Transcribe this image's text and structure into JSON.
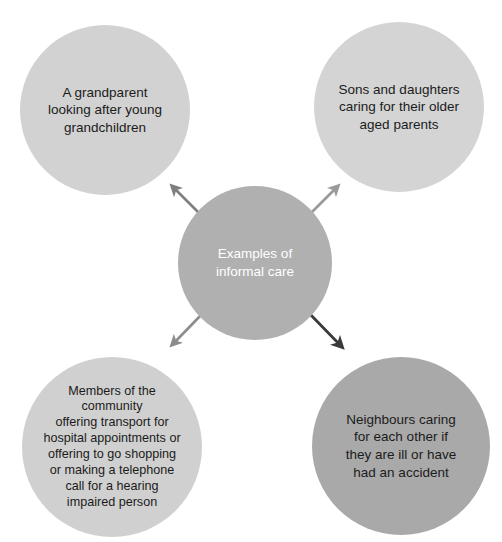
{
  "diagram": {
    "title": "Examples of informal care",
    "type": "hub-and-spoke",
    "background_color": "#ffffff",
    "center": {
      "name": "center-hub",
      "label": "Examples of\ninformal care",
      "fill_color": "#b0b0b0",
      "text_color": "#ffffff"
    },
    "nodes": [
      {
        "name": "grandparent",
        "label": "A grandparent\nlooking after young\ngrandchildren",
        "position": "top-left",
        "fill_color": "#d2d2d2",
        "text_color": "#1b1b1b"
      },
      {
        "name": "sons-daughters",
        "label": "Sons and daughters\ncaring for their older\naged parents",
        "position": "top-right",
        "fill_color": "#d4d4d4",
        "text_color": "#1b1b1b"
      },
      {
        "name": "community",
        "label": "Members of the\ncommunity\noffering transport for\nhospital appointments or\noffering to go shopping\nor making a telephone\ncall for a hearing\nimpaired person",
        "position": "bottom-left",
        "fill_color": "#d0d0d0",
        "text_color": "#1b1b1b"
      },
      {
        "name": "neighbours",
        "label": "Neighbours caring\nfor each other if\nthey are ill or have\nhad an accident",
        "position": "bottom-right",
        "fill_color": "#a9a9a9",
        "text_color": "#1b1b1b"
      }
    ],
    "arrows": [
      {
        "name": "arrow-to-grandparent",
        "from": "center-hub",
        "to": "grandparent",
        "direction": "up-left",
        "color": "#7f7f7f"
      },
      {
        "name": "arrow-to-sons-daughters",
        "from": "center-hub",
        "to": "sons-daughters",
        "direction": "up-right",
        "color": "#9a9a9a"
      },
      {
        "name": "arrow-to-community",
        "from": "center-hub",
        "to": "community",
        "direction": "down-left",
        "color": "#8c8c8c"
      },
      {
        "name": "arrow-to-neighbours",
        "from": "center-hub",
        "to": "neighbours",
        "direction": "down-right",
        "color": "#3a3a3a"
      }
    ]
  }
}
